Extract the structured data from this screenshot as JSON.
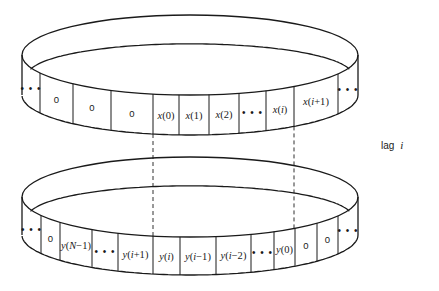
{
  "figure": {
    "label_parts": {
      "prefix": "lag",
      "variable": "i"
    },
    "top_ring": {
      "name": "x-buffer",
      "cells": [
        "...",
        "0",
        "0",
        "0",
        "x(0)",
        "x(1)",
        "x(2)",
        "...",
        "x(i)",
        "x(i+1)",
        "..."
      ]
    },
    "bottom_ring": {
      "name": "y-buffer",
      "cells": [
        "...",
        "0",
        "y(N−1)",
        "...",
        "y(i+1)",
        "y(i)",
        "y(i−1)",
        "y(i−2)",
        "...",
        "y(0)",
        "0",
        "0",
        "..."
      ]
    },
    "alignment_lines": [
      {
        "from": "x(0)",
        "to": "y(i)"
      },
      {
        "from": "x(i)",
        "to": "y(0)"
      }
    ]
  }
}
